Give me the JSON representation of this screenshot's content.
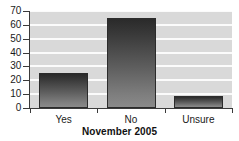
{
  "chart_data": {
    "type": "bar",
    "title": "November 2005",
    "xlabel": "",
    "ylabel": "",
    "categories": [
      "Yes",
      "No",
      "Unsure"
    ],
    "values": [
      25,
      65,
      9
    ],
    "series": [
      {
        "name": "November 2005",
        "values": [
          25,
          65,
          9
        ]
      }
    ],
    "ylim": [
      0,
      70
    ],
    "yticks": [
      0,
      10,
      20,
      30,
      40,
      50,
      60,
      70
    ],
    "ytick_labels": [
      "0",
      "10",
      "20",
      "30",
      "40",
      "50",
      "60",
      "70"
    ],
    "grid": true,
    "grid_axis": "y",
    "legend": false,
    "legend_position": "none",
    "bar_fill": "#4a4a4a",
    "bar_edge": "#2b2b2b",
    "plot_background": "#d9d9d9",
    "gridline_color": "#fbfbfb",
    "figure_background": "#ffffff"
  },
  "axes": {
    "y": {
      "ticks": [
        {
          "label": "70",
          "value": 70
        },
        {
          "label": "60",
          "value": 60
        },
        {
          "label": "50",
          "value": 50
        },
        {
          "label": "40",
          "value": 40
        },
        {
          "label": "30",
          "value": 30
        },
        {
          "label": "20",
          "value": 20
        },
        {
          "label": "10",
          "value": 10
        },
        {
          "label": "0",
          "value": 0
        }
      ]
    },
    "x": {
      "ticks": [
        {
          "label": "Yes"
        },
        {
          "label": "No"
        },
        {
          "label": "Unsure"
        }
      ]
    }
  },
  "title": {
    "text": "November 2005"
  }
}
